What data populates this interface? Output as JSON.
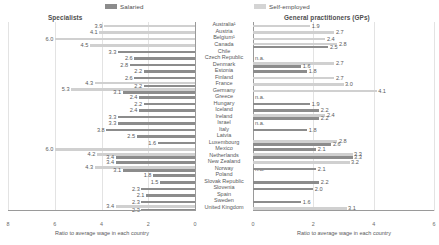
{
  "legend": {
    "salaried_label": "Salaried",
    "selfemployed_label": "Self-employed",
    "salaried_color": "#8c8c8c",
    "selfemployed_color": "#d0d0d0"
  },
  "panels": {
    "left_title": "Specialists",
    "right_title": "General practitioners (GPs)",
    "axis_caption": "Ratio to average wage in each country"
  },
  "axes": {
    "left_ticks": [
      "8",
      "6",
      "4",
      "2",
      "0"
    ],
    "right_ticks": [
      "0",
      "2",
      "4",
      "6"
    ],
    "left_max": 8,
    "right_max": 6,
    "left_reversed": true
  },
  "na_label": "n.a.",
  "chart_data": {
    "type": "bar",
    "subtitle": "Specialists and General practitioners (GPs), salaried and self-employed",
    "xlabel": "Ratio to average wage in each country",
    "ylabel": "",
    "orientation": "horizontal",
    "layout": "butterfly",
    "grid": true,
    "legend_position": "top",
    "series_names": [
      "Salaried",
      "Self-employed"
    ],
    "categories": [
      "Australia¹",
      "Austria",
      "Belgium¹",
      "Canada",
      "Chile",
      "Czech Republic",
      "Denmark",
      "Estonia",
      "Finland",
      "France",
      "Germany",
      "Greece",
      "Hungary",
      "Iceland",
      "Ireland",
      "Israel",
      "Italy",
      "Latvia",
      "Luxembourg",
      "Mexico",
      "Netherlands",
      "New Zealand",
      "Norway",
      "Poland",
      "Slovak Republic",
      "Slovenia",
      "Spain",
      "Sweden",
      "United Kingdom"
    ],
    "specialists": {
      "xlim": [
        0,
        8
      ],
      "reversed": true,
      "salaried": [
        null,
        null,
        null,
        null,
        3.3,
        2.6,
        2.8,
        2.2,
        2.6,
        2.2,
        3.1,
        2.4,
        2.2,
        2.4,
        3.3,
        3.3,
        3.8,
        2.5,
        1.6,
        null,
        3.4,
        3.4,
        3.1,
        1.8,
        1.5,
        2.3,
        2.1,
        2.3,
        2.3
      ],
      "self_employed": [
        3.9,
        4.1,
        6.0,
        4.5,
        null,
        null,
        null,
        null,
        null,
        4.3,
        5.3,
        null,
        null,
        null,
        null,
        null,
        null,
        null,
        null,
        6.0,
        4.2,
        null,
        4.3,
        null,
        null,
        null,
        null,
        null,
        3.4
      ]
    },
    "general_practitioners": {
      "xlim": [
        0,
        6
      ],
      "reversed": false,
      "salaried": [
        null,
        null,
        null,
        2.5,
        null,
        null,
        1.6,
        1.8,
        null,
        null,
        null,
        null,
        1.9,
        2.2,
        2.2,
        null,
        1.8,
        null,
        2.6,
        2.1,
        3.3,
        null,
        2.1,
        null,
        2.2,
        2.0,
        null,
        1.6,
        null
      ],
      "self_employed": [
        1.9,
        2.7,
        2.4,
        2.8,
        null,
        "n.a.",
        2.7,
        null,
        2.7,
        3.0,
        4.1,
        "n.a.",
        null,
        null,
        2.4,
        "n.a.",
        null,
        null,
        2.8,
        null,
        3.3,
        3.2,
        "n.a.",
        null,
        "n.a.",
        null,
        null,
        null,
        3.1
      ]
    }
  }
}
